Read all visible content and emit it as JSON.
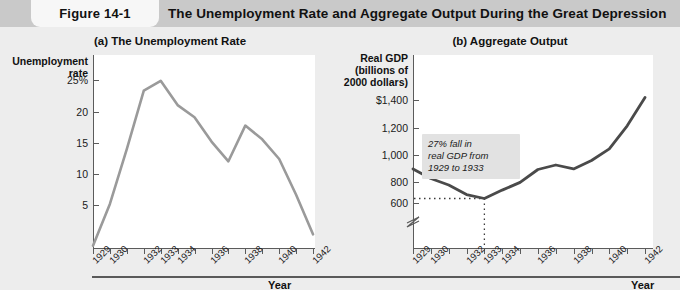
{
  "header": {
    "figure_tab": "Figure 14-1",
    "title": "The Unemployment Rate and Aggregate Output During the Great Depression"
  },
  "panel_a": {
    "title": "(a) The Unemployment Rate",
    "y_axis_title": "Unemployment\nrate",
    "x_axis_name": "Year",
    "y_ticks": [
      "25%",
      "20",
      "15",
      "10",
      "5"
    ],
    "x_ticks": [
      "1929",
      "1930",
      "1932",
      "1933",
      "1934",
      "1936",
      "1938",
      "1940",
      "1942"
    ]
  },
  "panel_b": {
    "title": "(b) Aggregate Output",
    "y_axis_title": "Real GDP\n(billions of\n2000 dollars)",
    "x_axis_name": "Year",
    "y_ticks": [
      "$1,400",
      "1,200",
      "1,000",
      "800",
      "600"
    ],
    "x_ticks": [
      "1929",
      "1930",
      "1932",
      "1933",
      "1934",
      "1936",
      "1938",
      "1940",
      "1942"
    ],
    "annotation": "27% fall in\nreal GDP from\n1929 to 1933",
    "axis_break": true
  },
  "colors": {
    "page_background": "#ededed",
    "header_band": "#c9c9c9",
    "figure_tab": "#f7f7f7",
    "plot_background": "#ffffff",
    "axis": "#5b5b5b",
    "unemployment_line": "#9a9a9a",
    "gdp_line": "#4a4a4a",
    "annotation_background": "#e2e2e2",
    "dotted_guide": "#3a3a3a"
  },
  "chart_data": [
    {
      "type": "line",
      "title": "(a) The Unemployment Rate",
      "xlabel": "Year",
      "ylabel": "Unemployment rate",
      "xlim": [
        1929,
        1942
      ],
      "ylim": [
        0,
        27
      ],
      "yunit": "percent",
      "grid": false,
      "legend": "none",
      "x": [
        1929,
        1930,
        1931,
        1932,
        1933,
        1934,
        1935,
        1936,
        1937,
        1938,
        1939,
        1940,
        1941,
        1942
      ],
      "values": [
        3.2,
        8.7,
        15.9,
        23.6,
        24.9,
        21.7,
        20.1,
        16.9,
        14.3,
        19.0,
        17.2,
        14.6,
        9.9,
        4.7
      ],
      "series": [
        {
          "name": "Unemployment rate",
          "color": "#9a9a9a",
          "values": [
            3.2,
            8.7,
            15.9,
            23.6,
            24.9,
            21.7,
            20.1,
            16.9,
            14.3,
            19.0,
            17.2,
            14.6,
            9.9,
            4.7
          ]
        }
      ]
    },
    {
      "type": "line",
      "title": "(b) Aggregate Output",
      "xlabel": "Year",
      "ylabel": "Real GDP (billions of 2000 dollars)",
      "xlim": [
        1929,
        1942
      ],
      "ylim": [
        560,
        1460
      ],
      "yunit": "billions of 2000 dollars",
      "grid": false,
      "legend": "none",
      "axis_break_at": 560,
      "annotations": [
        "27% fall in real GDP from 1929 to 1933"
      ],
      "guides": {
        "horizontal_dotted_value": 635,
        "vertical_dotted_x": 1933
      },
      "x": [
        1929,
        1930,
        1931,
        1932,
        1933,
        1934,
        1935,
        1936,
        1937,
        1938,
        1939,
        1940,
        1941,
        1942
      ],
      "values": [
        865,
        790,
        740,
        665,
        635,
        700,
        760,
        860,
        895,
        865,
        930,
        1020,
        1200,
        1420
      ],
      "series": [
        {
          "name": "Real GDP",
          "color": "#4a4a4a",
          "values": [
            865,
            790,
            740,
            665,
            635,
            700,
            760,
            860,
            895,
            865,
            930,
            1020,
            1200,
            1420
          ]
        }
      ]
    }
  ]
}
